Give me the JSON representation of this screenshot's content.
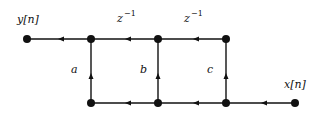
{
  "diagram": {
    "type": "signal-flow-graph",
    "nodes": [
      {
        "id": "y",
        "label": "y[n]"
      },
      {
        "id": "t1"
      },
      {
        "id": "t2"
      },
      {
        "id": "t3"
      },
      {
        "id": "b1"
      },
      {
        "id": "b2"
      },
      {
        "id": "b3"
      },
      {
        "id": "x",
        "label": "x[n]"
      }
    ],
    "edges": [
      {
        "from": "x",
        "to": "b3",
        "label": ""
      },
      {
        "from": "b3",
        "to": "b2",
        "label": ""
      },
      {
        "from": "b2",
        "to": "b1",
        "label": ""
      },
      {
        "from": "b1",
        "to": "t1",
        "label": "a"
      },
      {
        "from": "b2",
        "to": "t2",
        "label": "b"
      },
      {
        "from": "b3",
        "to": "t3",
        "label": "c"
      },
      {
        "from": "t3",
        "to": "t2",
        "label": "z^-1"
      },
      {
        "from": "t2",
        "to": "t1",
        "label": "z^-1"
      },
      {
        "from": "t1",
        "to": "y",
        "label": ""
      }
    ],
    "labels": {
      "output": "y[n]",
      "input": "x[n]",
      "delay_base": "z",
      "delay_exp": "−1",
      "gain_a": "a",
      "gain_b": "b",
      "gain_c": "c"
    }
  }
}
